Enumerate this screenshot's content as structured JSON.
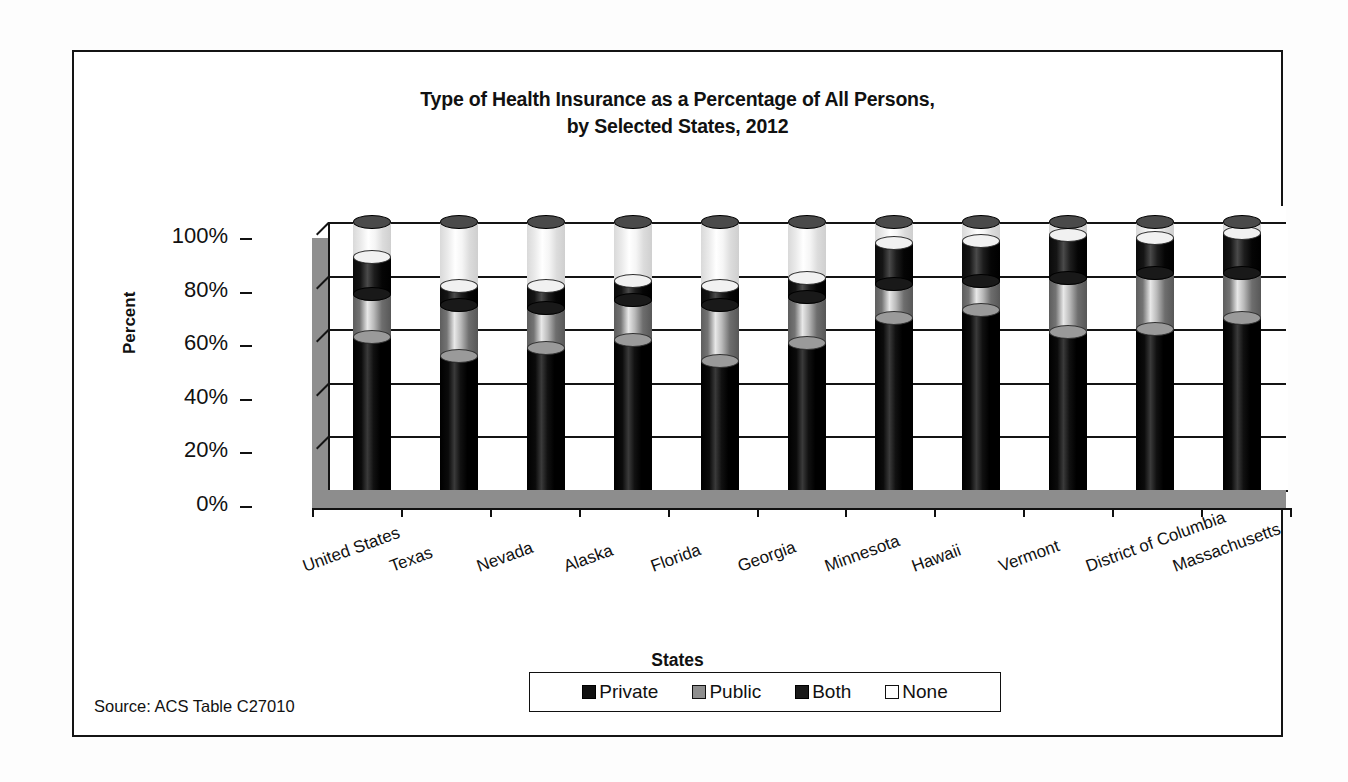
{
  "figure": {
    "title_line1": "Type of Health Insurance as a Percentage of All Persons,",
    "title_line2": "by Selected States, 2012",
    "source": "Source: ACS Table C27010",
    "y_axis_title": "Percent",
    "x_axis_title": "States"
  },
  "chart_data": {
    "type": "bar",
    "subtype": "stacked-100-percent-3d-cylinder",
    "title": "Type of Health Insurance as a Percentage of All Persons, by Selected States, 2012",
    "xlabel": "States",
    "ylabel": "Percent",
    "ylim": [
      0,
      100
    ],
    "yticks": [
      0,
      20,
      40,
      60,
      80,
      100
    ],
    "ytick_labels": [
      "0%",
      "20%",
      "40%",
      "60%",
      "80%",
      "100%"
    ],
    "grid": true,
    "legend_position": "bottom",
    "stacked": true,
    "categories": [
      "United States",
      "Texas",
      "Nevada",
      "Alaska",
      "Florida",
      "Georgia",
      "Minnesota",
      "Hawaii",
      "Vermont",
      "District of Columbia",
      "Massachusetts"
    ],
    "series": [
      {
        "name": "Private",
        "color": "#111111",
        "values": [
          57,
          50,
          53,
          56,
          48,
          55,
          64,
          67,
          59,
          60,
          64
        ]
      },
      {
        "name": "Public",
        "color": "#8e8e8e",
        "values": [
          16,
          19,
          15,
          15,
          21,
          17,
          13,
          11,
          20,
          21,
          17
        ]
      },
      {
        "name": "Both",
        "color": "#1a1a1a",
        "values": [
          14,
          7,
          8,
          7,
          7,
          7,
          15,
          15,
          16,
          13,
          15
        ]
      },
      {
        "name": "None",
        "color": "#ffffff",
        "values": [
          13,
          24,
          24,
          22,
          24,
          21,
          8,
          7,
          5,
          6,
          4
        ]
      }
    ],
    "annotations": [
      "Source: ACS Table C27010"
    ]
  },
  "legend": {
    "items": [
      {
        "label": "Private",
        "swatch": "sw-private"
      },
      {
        "label": "Public",
        "swatch": "sw-public"
      },
      {
        "label": "Both",
        "swatch": "sw-both"
      },
      {
        "label": "None",
        "swatch": "sw-none"
      }
    ]
  }
}
